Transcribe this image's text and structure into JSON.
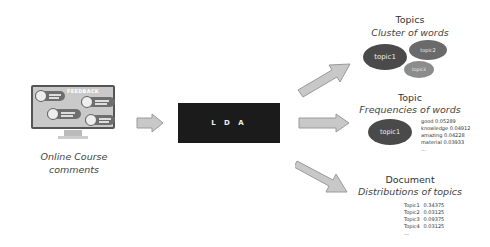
{
  "input": {
    "illustration": {
      "screen_title": "FEEDBACK",
      "description": "monitor with feedback comment bubbles"
    },
    "caption_line1": "Online Course",
    "caption_line2": "comments"
  },
  "process": {
    "label": "L D A"
  },
  "outputs": {
    "topics": {
      "heading": "Topics",
      "subheading": "Cluster of words",
      "clusters": [
        {
          "label": "topic1",
          "color": "#4a4a4a"
        },
        {
          "label": "topic2",
          "color": "#6a6a6a"
        },
        {
          "label": "topic3",
          "color": "#8c8c8c"
        }
      ]
    },
    "topic": {
      "heading": "Topic",
      "subheading": "Frequencies of words",
      "ellipse_label": "topic1",
      "words": [
        {
          "word": "good",
          "value": "0.05289"
        },
        {
          "word": "knowledge",
          "value": "0.04912"
        },
        {
          "word": "amazing",
          "value": "0.04228"
        },
        {
          "word": "material",
          "value": "0.03933"
        }
      ],
      "more": "..."
    },
    "document": {
      "heading": "Document",
      "subheading": "Distributions of topics",
      "distribution": [
        {
          "topic": "Topic1",
          "value": "0.34375"
        },
        {
          "topic": "Topic2",
          "value": "0.03125"
        },
        {
          "topic": "Topic3",
          "value": "0.09375"
        },
        {
          "topic": "Topic4",
          "value": "0.03125"
        }
      ],
      "more": "..."
    }
  },
  "colors": {
    "arrow_fill": "#c8c8c8",
    "arrow_stroke": "#9a9a9a",
    "lda_box": "#1b1b1b"
  }
}
